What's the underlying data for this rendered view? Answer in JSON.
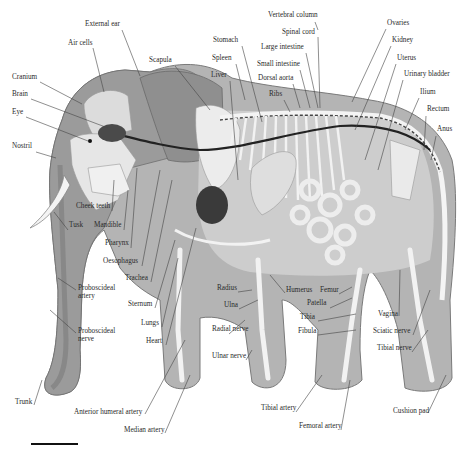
{
  "figure": {
    "palette": {
      "skin_dark": "#8f8f8f",
      "skin_mid": "#b4b4b4",
      "body_light": "#d6d6d6",
      "bone": "#f2f2f2",
      "organ_dark": "#3a3a3a",
      "vessel": "#222222",
      "leader": "#444444"
    }
  },
  "labels": [
    {
      "id": "external-ear",
      "text": "External ear",
      "x": 85,
      "y": 26,
      "lx1": 122,
      "ly1": 30,
      "lx2": 140,
      "ly2": 76
    },
    {
      "id": "air-cells",
      "text": "Air cells",
      "x": 68,
      "y": 45,
      "lx1": 93,
      "ly1": 48,
      "lx2": 104,
      "ly2": 92
    },
    {
      "id": "scapula",
      "text": "Scapula",
      "x": 149,
      "y": 62,
      "lx1": 175,
      "ly1": 66,
      "lx2": 210,
      "ly2": 110
    },
    {
      "id": "cranium",
      "text": "Cranium",
      "x": 12,
      "y": 79,
      "lx1": 40,
      "ly1": 82,
      "lx2": 82,
      "ly2": 104
    },
    {
      "id": "brain",
      "text": "Brain",
      "x": 12,
      "y": 96,
      "lx1": 31,
      "ly1": 99,
      "lx2": 108,
      "ly2": 128
    },
    {
      "id": "eye",
      "text": "Eye",
      "x": 12,
      "y": 114,
      "lx1": 26,
      "ly1": 117,
      "lx2": 88,
      "ly2": 141
    },
    {
      "id": "nostril",
      "text": "Nostril",
      "x": 12,
      "y": 148,
      "lx1": 36,
      "ly1": 152,
      "lx2": 56,
      "ly2": 158
    },
    {
      "id": "stomach",
      "text": "Stomach",
      "x": 213,
      "y": 42,
      "lx1": 242,
      "ly1": 46,
      "lx2": 262,
      "ly2": 122
    },
    {
      "id": "spleen",
      "text": "Spleen",
      "x": 212,
      "y": 60,
      "lx1": 236,
      "ly1": 64,
      "lx2": 245,
      "ly2": 100
    },
    {
      "id": "liver",
      "text": "Liver",
      "x": 211,
      "y": 77,
      "lx1": 230,
      "ly1": 81,
      "lx2": 238,
      "ly2": 180
    },
    {
      "id": "vertebral-column",
      "text": "Vertebral column",
      "x": 268,
      "y": 17,
      "lx1": 315,
      "ly1": 22,
      "lx2": 318,
      "ly2": 30
    },
    {
      "id": "spinal-cord",
      "text": "Spinal cord",
      "x": 282,
      "y": 34,
      "lx1": 318,
      "ly1": 37,
      "lx2": 320,
      "ly2": 108
    },
    {
      "id": "large-intestine",
      "text": "Large intestine",
      "x": 261,
      "y": 49,
      "lx1": 306,
      "ly1": 53,
      "lx2": 318,
      "ly2": 108
    },
    {
      "id": "small-intestine",
      "text": "Small intestine",
      "x": 257,
      "y": 66,
      "lx1": 300,
      "ly1": 70,
      "lx2": 310,
      "ly2": 108
    },
    {
      "id": "dorsal-aorta",
      "text": "Dorsal aorta",
      "x": 258,
      "y": 80,
      "lx1": 293,
      "ly1": 84,
      "lx2": 300,
      "ly2": 108
    },
    {
      "id": "ribs",
      "text": "Ribs",
      "x": 269,
      "y": 96,
      "lx1": 284,
      "ly1": 100,
      "lx2": 290,
      "ly2": 112
    },
    {
      "id": "ovaries",
      "text": "Ovaries",
      "x": 387,
      "y": 25,
      "lx1": 386,
      "ly1": 29,
      "lx2": 352,
      "ly2": 102
    },
    {
      "id": "kidney",
      "text": "Kidney",
      "x": 392,
      "y": 42,
      "lx1": 391,
      "ly1": 46,
      "lx2": 355,
      "ly2": 130
    },
    {
      "id": "uterus",
      "text": "Uterus",
      "x": 397,
      "y": 60,
      "lx1": 396,
      "ly1": 64,
      "lx2": 365,
      "ly2": 160
    },
    {
      "id": "urinary-bladder",
      "text": "Urinary bladder",
      "x": 404,
      "y": 76,
      "lx1": 403,
      "ly1": 80,
      "lx2": 378,
      "ly2": 170
    },
    {
      "id": "ilium",
      "text": "Ilium",
      "x": 420,
      "y": 94,
      "lx1": 419,
      "ly1": 98,
      "lx2": 405,
      "ly2": 130
    },
    {
      "id": "rectum",
      "text": "Rectum",
      "x": 427,
      "y": 111,
      "lx1": 426,
      "ly1": 116,
      "lx2": 424,
      "ly2": 150
    },
    {
      "id": "anus",
      "text": "Anus",
      "x": 437,
      "y": 131,
      "lx1": 436,
      "ly1": 136,
      "lx2": 431,
      "ly2": 160
    },
    {
      "id": "cheek-teeth",
      "text": "Cheek teeth",
      "x": 76,
      "y": 208,
      "lx1": 112,
      "ly1": 211,
      "lx2": 114,
      "ly2": 180
    },
    {
      "id": "tusk",
      "text": "Tusk",
      "x": 69,
      "y": 227,
      "lx1": 68,
      "ly1": 230,
      "lx2": 54,
      "ly2": 212
    },
    {
      "id": "mandible",
      "text": "Mandible",
      "x": 94,
      "y": 227,
      "lx1": 124,
      "ly1": 230,
      "lx2": 128,
      "ly2": 190
    },
    {
      "id": "pharynx",
      "text": "Pharynx",
      "x": 105,
      "y": 245,
      "lx1": 131,
      "ly1": 248,
      "lx2": 137,
      "ly2": 168
    },
    {
      "id": "oesophagus",
      "text": "Oesophagus",
      "x": 103,
      "y": 263,
      "lx1": 142,
      "ly1": 266,
      "lx2": 160,
      "ly2": 170
    },
    {
      "id": "trachea",
      "text": "Trachea",
      "x": 125,
      "y": 280,
      "lx1": 151,
      "ly1": 282,
      "lx2": 172,
      "ly2": 180
    },
    {
      "id": "proboscideal-artery",
      "text": "Proboscideal artery",
      "x": 78,
      "y": 290,
      "lx1": 76,
      "ly1": 290,
      "lx2": 58,
      "ly2": 278,
      "wrap": true
    },
    {
      "id": "sternum",
      "text": "Sternum",
      "x": 128,
      "y": 306,
      "lx1": 155,
      "ly1": 308,
      "lx2": 175,
      "ly2": 240
    },
    {
      "id": "lungs",
      "text": "Lungs",
      "x": 141,
      "y": 325,
      "lx1": 162,
      "ly1": 327,
      "lx2": 178,
      "ly2": 258
    },
    {
      "id": "heart",
      "text": "Heart",
      "x": 146,
      "y": 343,
      "lx1": 166,
      "ly1": 345,
      "lx2": 196,
      "ly2": 228
    },
    {
      "id": "proboscideal-nerve",
      "text": "Proboscideal nerve",
      "x": 78,
      "y": 333,
      "lx1": 76,
      "ly1": 333,
      "lx2": 50,
      "ly2": 310,
      "wrap": true
    },
    {
      "id": "trunk",
      "text": "Trunk",
      "x": 15,
      "y": 404,
      "lx1": 34,
      "ly1": 405,
      "lx2": 42,
      "ly2": 380
    },
    {
      "id": "anterior-humeral-artery",
      "text": "Anterior humeral artery",
      "x": 74,
      "y": 414,
      "lx1": 145,
      "ly1": 414,
      "lx2": 185,
      "ly2": 340
    },
    {
      "id": "median-artery",
      "text": "Median artery",
      "x": 124,
      "y": 432,
      "lx1": 165,
      "ly1": 433,
      "lx2": 190,
      "ly2": 375
    },
    {
      "id": "radius",
      "text": "Radius",
      "x": 217,
      "y": 290,
      "lx1": 238,
      "ly1": 292,
      "lx2": 252,
      "ly2": 290
    },
    {
      "id": "ulna",
      "text": "Ulna",
      "x": 224,
      "y": 307,
      "lx1": 239,
      "ly1": 309,
      "lx2": 258,
      "ly2": 300
    },
    {
      "id": "humerus",
      "text": "Humerus",
      "x": 286,
      "y": 292,
      "lx1": 285,
      "ly1": 293,
      "lx2": 270,
      "ly2": 275
    },
    {
      "id": "radial-nerve",
      "text": "Radial nerve",
      "x": 212,
      "y": 331,
      "lx1": 229,
      "ly1": 334,
      "lx2": 245,
      "ly2": 320,
      "wrap": true
    },
    {
      "id": "ulnar-nerve",
      "text": "Ulnar nerve",
      "x": 212,
      "y": 358,
      "lx1": 246,
      "ly1": 360,
      "lx2": 252,
      "ly2": 350
    },
    {
      "id": "femur",
      "text": "Femur",
      "x": 320,
      "y": 292,
      "lx1": 339,
      "ly1": 294,
      "lx2": 352,
      "ly2": 287
    },
    {
      "id": "patella",
      "text": "Patella",
      "x": 307,
      "y": 305,
      "lx1": 330,
      "ly1": 308,
      "lx2": 352,
      "ly2": 298
    },
    {
      "id": "tibia",
      "text": "Tibia",
      "x": 300,
      "y": 319,
      "lx1": 318,
      "ly1": 321,
      "lx2": 356,
      "ly2": 314
    },
    {
      "id": "fibula",
      "text": "Fibula",
      "x": 298,
      "y": 333,
      "lx1": 318,
      "ly1": 335,
      "lx2": 356,
      "ly2": 330
    },
    {
      "id": "vagina",
      "text": "Vagina",
      "x": 378,
      "y": 316,
      "lx1": 399,
      "ly1": 316,
      "lx2": 400,
      "ly2": 270
    },
    {
      "id": "sciatic-nerve",
      "text": "Sciatic nerve",
      "x": 373,
      "y": 333,
      "lx1": 413,
      "ly1": 335,
      "lx2": 430,
      "ly2": 290
    },
    {
      "id": "tibial-nerve",
      "text": "Tibial nerve",
      "x": 377,
      "y": 350,
      "lx1": 412,
      "ly1": 352,
      "lx2": 428,
      "ly2": 330
    },
    {
      "id": "tibial-artery",
      "text": "Tibial artery",
      "x": 261,
      "y": 410,
      "lx1": 296,
      "ly1": 412,
      "lx2": 322,
      "ly2": 375
    },
    {
      "id": "femoral-artery",
      "text": "Femoral artery",
      "x": 299,
      "y": 428,
      "lx1": 341,
      "ly1": 430,
      "lx2": 350,
      "ly2": 380
    },
    {
      "id": "cushion-pad",
      "text": "Cushion pad",
      "x": 393,
      "y": 413,
      "lx1": 428,
      "ly1": 413,
      "lx2": 446,
      "ly2": 375
    }
  ],
  "scale_bar": {
    "x": 31,
    "y": 443,
    "width": 47
  }
}
